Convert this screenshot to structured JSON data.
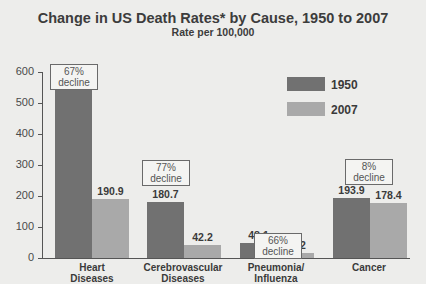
{
  "chart_data": {
    "type": "bar",
    "title": "Change in US Death Rates* by Cause, 1950 to 2007",
    "subtitle": "Rate per 100,000",
    "xlabel": "",
    "ylabel": "",
    "ylim": [
      0,
      600
    ],
    "yticks": [
      "0",
      "100",
      "200",
      "300",
      "400",
      "500",
      "600"
    ],
    "grid": false,
    "legend_position": "upper right",
    "categories": [
      "Heart Diseases",
      "Cerebrovascular Diseases",
      "Pneumonia/ Influenza",
      "Cancer"
    ],
    "series": [
      {
        "name": "1950",
        "color": "#717171",
        "values": [
          586.8,
          180.7,
          48.1,
          193.9
        ],
        "labels": [
          "586.8",
          "180.7",
          "48.1",
          "193.9"
        ]
      },
      {
        "name": "2007",
        "color": "#a9a9a9",
        "values": [
          190.9,
          42.2,
          16.2,
          178.4
        ],
        "labels": [
          "190.9",
          "42.2",
          "16.2",
          "178.4"
        ]
      }
    ],
    "annotations": [
      {
        "category": "Heart Diseases",
        "pct": "67%",
        "word": "decline"
      },
      {
        "category": "Cerebrovascular Diseases",
        "pct": "77%",
        "word": "decline"
      },
      {
        "category": "Pneumonia/ Influenza",
        "pct": "66%",
        "word": "decline"
      },
      {
        "category": "Cancer",
        "pct": "8%",
        "word": "decline"
      }
    ]
  },
  "cats": [
    {
      "l1": "Heart",
      "l2": "Diseases"
    },
    {
      "l1": "Cerebrovascular",
      "l2": "Diseases"
    },
    {
      "l1": "Pneumonia/",
      "l2": "Influenza"
    },
    {
      "l1": "Cancer",
      "l2": ""
    }
  ]
}
